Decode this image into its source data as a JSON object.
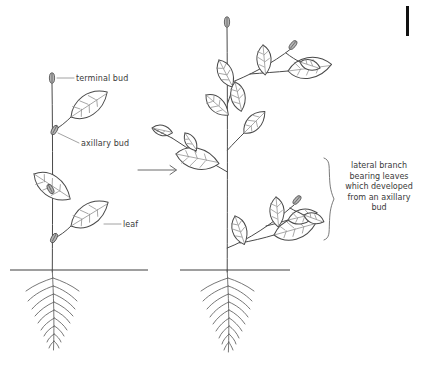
{
  "figure": {
    "background_color": "#ffffff",
    "ink_color": "#4a4a4a",
    "text_color": "#3a3a3a"
  },
  "labels": {
    "terminal_bud": "terminal bud",
    "axillary_bud": "axillary bud",
    "leaf": "leaf",
    "lateral_branch_caption": "lateral branch bearing leaves which developed from an axillary bud"
  },
  "panels": {
    "left": {
      "name": "young plant before branching",
      "stem_x": 52,
      "terminal_bud": {
        "x": 52,
        "y": 78
      },
      "axillary_buds": [
        {
          "x": 53,
          "y": 130
        },
        {
          "x": 53,
          "y": 189
        },
        {
          "x": 53,
          "y": 238
        }
      ],
      "leaves": 3
    },
    "right": {
      "name": "older plant after axillary buds developed into lateral branches",
      "stem_x": 227,
      "terminal_bud": {
        "x": 227,
        "y": 22
      },
      "lateral_branches": 3,
      "leaves": 10
    }
  },
  "ground": {
    "left_line": {
      "x1": 10,
      "x2": 148,
      "y": 270
    },
    "right_line": {
      "x1": 180,
      "x2": 290,
      "y": 270
    }
  },
  "arrow": {
    "name": "transformation-arrow",
    "direction": "right",
    "x1": 138,
    "x2": 178,
    "y": 170
  },
  "brace": {
    "top": 158,
    "bottom": 240,
    "x": 330
  },
  "corner_mark": {
    "x": 406,
    "y": 6,
    "width": 3,
    "height": 30,
    "color": "#111111"
  }
}
